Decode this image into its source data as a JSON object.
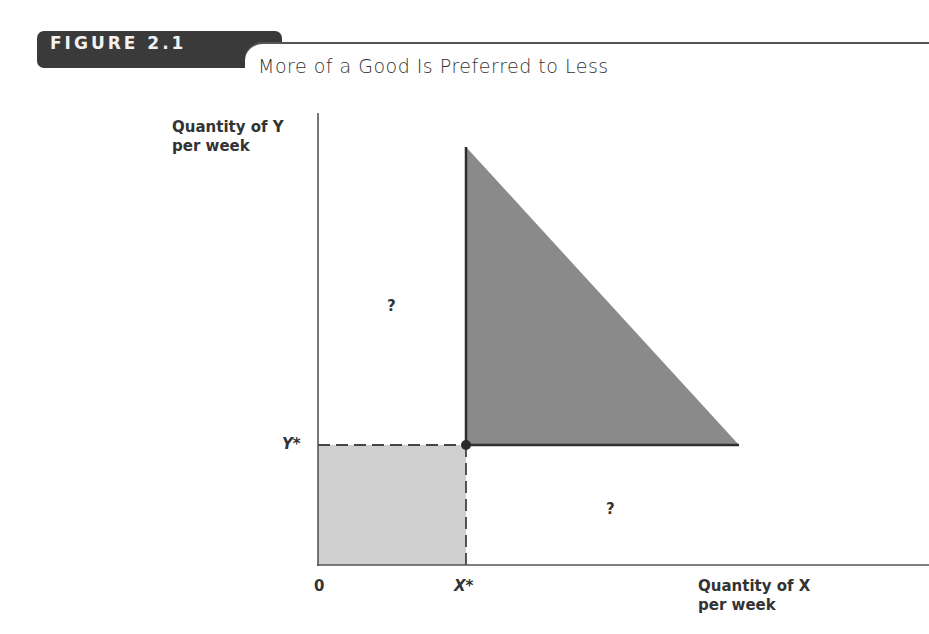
{
  "figure": {
    "number_label": "FIGURE 2.1",
    "title": "More of a Good Is Preferred to Less"
  },
  "axes": {
    "y_label_line1": "Quantity of Y",
    "y_label_line2": "per week",
    "x_label_line1": "Quantity of X",
    "x_label_line2": "per week",
    "origin": "0",
    "x_star": "X*",
    "y_star": "Y*"
  },
  "regions": {
    "upper_left_mark": "?",
    "lower_right_mark": "?"
  },
  "colors": {
    "dark_region": "#8a8a8a",
    "light_region": "#cfcfcf",
    "axis": "#555555",
    "tab": "#3a3a3a"
  }
}
